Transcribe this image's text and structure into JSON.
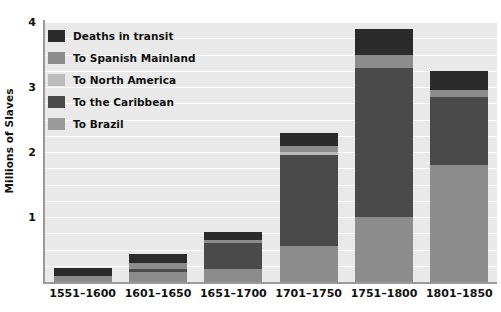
{
  "chart_data": {
    "type": "bar",
    "subtype": "stacked",
    "title": "",
    "xlabel": "",
    "ylabel": "Millions of Slaves",
    "ylim": [
      0,
      4
    ],
    "y_ticks": [
      1,
      2,
      3,
      4
    ],
    "y_tick_labels": [
      "1",
      "2",
      "3",
      "4"
    ],
    "grid": true,
    "grid_orientation": "horizontal",
    "grid_step": 0.25,
    "legend_position": "upper left",
    "categories": [
      "1551–1600",
      "1601–1650",
      "1651–1700",
      "1701–1750",
      "1751–1800",
      "1801–1850"
    ],
    "stack_order_bottom_to_top": [
      "To Brazil",
      "To the Caribbean",
      "To North America",
      "To Spanish Mainland",
      "Deaths in transit"
    ],
    "series": [
      {
        "name": "To Brazil",
        "color": "#8c8c8c",
        "values": [
          0.1,
          0.15,
          0.2,
          0.55,
          1.0,
          1.8
        ]
      },
      {
        "name": "To the Caribbean",
        "color": "#4a4a4a",
        "values": [
          0.0,
          0.05,
          0.4,
          1.4,
          2.3,
          1.05
        ]
      },
      {
        "name": "To North America",
        "color": "#bcbcbc",
        "values": [
          0.0,
          0.0,
          0.0,
          0.05,
          0.0,
          0.0
        ]
      },
      {
        "name": "To Spanish Mainland",
        "color": "#8c8c8c",
        "values": [
          0.0,
          0.1,
          0.05,
          0.1,
          0.2,
          0.1
        ]
      },
      {
        "name": "Deaths in transit",
        "color": "#2b2b2b",
        "values": [
          0.12,
          0.13,
          0.12,
          0.2,
          0.4,
          0.3
        ]
      }
    ],
    "totals": [
      0.22,
      0.43,
      0.77,
      2.3,
      3.9,
      3.25
    ],
    "colors": {
      "plot_background": "#e9e9e9",
      "gridline": "#fdfdfd",
      "axis": "#9a9a9a",
      "text": "#111111",
      "deaths_in_transit": "#2b2b2b",
      "to_spanish_mainland": "#8c8c8c",
      "to_north_america": "#bcbcbc",
      "to_the_caribbean": "#4a4a4a",
      "to_brazil": "#8c8c8c"
    }
  },
  "legend": {
    "items": [
      {
        "label": "Deaths in transit",
        "color": "#2b2b2b"
      },
      {
        "label": "To Spanish Mainland",
        "color": "#8c8c8c"
      },
      {
        "label": "To North America",
        "color": "#bcbcbc"
      },
      {
        "label": "To the Caribbean",
        "color": "#4a4a4a"
      },
      {
        "label": "To Brazil",
        "color": "#9a9a9a"
      }
    ]
  },
  "axes": {
    "y_title": "Millions of Slaves"
  }
}
